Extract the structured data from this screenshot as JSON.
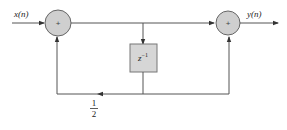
{
  "diagram": {
    "type": "signal-flow block diagram",
    "input_label": "x(n)",
    "output_label": "y(n)",
    "adder1": {
      "symbol": "+"
    },
    "adder2": {
      "symbol": "+"
    },
    "delay_block": {
      "label_base": "z",
      "label_exp": "−1"
    },
    "feedback_gain": {
      "numerator": "1",
      "denominator": "2"
    },
    "colors": {
      "line": "#555555",
      "adder_fill": "#cfcfcf",
      "adder_stroke": "#666666",
      "block_fill": "#d6d6d6",
      "block_stroke": "#777777"
    }
  }
}
